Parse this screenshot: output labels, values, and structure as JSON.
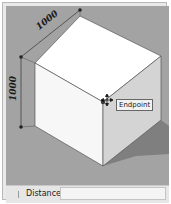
{
  "viewport": {
    "background_color": "#a3a3a3",
    "dimensions": {
      "top_edge": "1000",
      "left_edge": "1000"
    },
    "inference_tooltip": "Endpoint",
    "cursor": "move-cursor"
  },
  "statusbar": {
    "measurement_label": "Distance",
    "measurement_value": ""
  },
  "colors": {
    "cube_top": "#ffffff",
    "cube_left": "#f8f8f8",
    "cube_right": "#d6d6d6",
    "shadow": "#7d7d7d",
    "dimension_line": "#333333"
  }
}
